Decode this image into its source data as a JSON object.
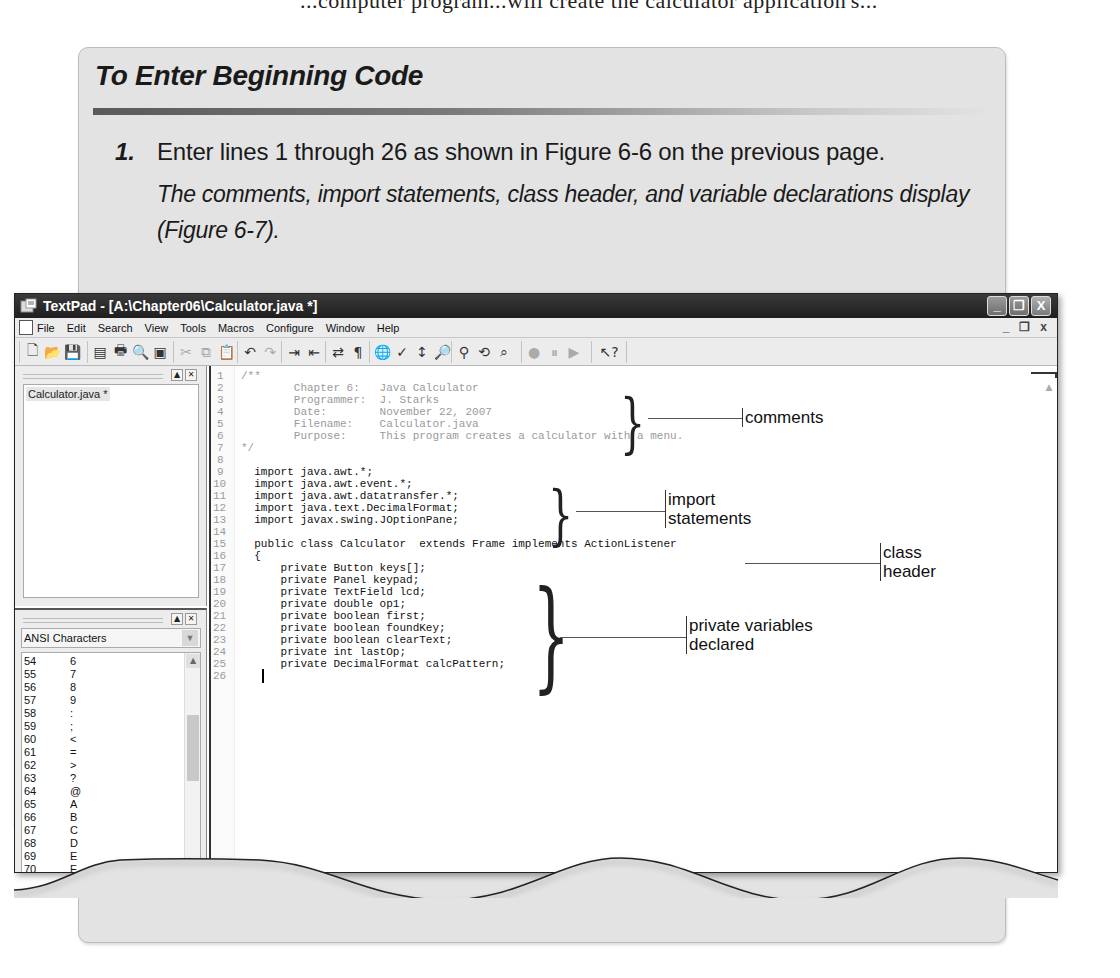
{
  "page": {
    "top_bleed_text": "...computer program...will create the calculator application's..."
  },
  "panel": {
    "title": "To Enter Beginning Code",
    "step_number": "1.",
    "step_text": "Enter lines 1 through 26 as shown in Figure 6-6 on the previous page.",
    "step_result": "The comments, import statements, class header, and variable declarations display (Figure 6-7).",
    "figure_caption": "FIGURE 6-7"
  },
  "window": {
    "title": "TextPad - [A:\\Chapter06\\Calculator.java *]",
    "controls": {
      "minimize": "_",
      "restore": "❐",
      "close": "X"
    },
    "menu": [
      "File",
      "Edit",
      "Search",
      "View",
      "Tools",
      "Macros",
      "Configure",
      "Window",
      "Help"
    ],
    "mdi_controls": {
      "minimize": "_",
      "restore": "❐",
      "close": "x"
    },
    "toolbar_groups": [
      [
        {
          "icon": "new-file-icon",
          "glyph": "🗋"
        },
        {
          "icon": "open-folder-icon",
          "glyph": "📂"
        },
        {
          "icon": "save-icon",
          "glyph": "💾"
        }
      ],
      [
        {
          "icon": "manage-files-icon",
          "glyph": "▤"
        },
        {
          "icon": "print-icon",
          "glyph": "🖶"
        },
        {
          "icon": "print-preview-icon",
          "glyph": "🔍"
        },
        {
          "icon": "properties-icon",
          "glyph": "▣"
        }
      ],
      [
        {
          "icon": "cut-icon",
          "glyph": "✂"
        },
        {
          "icon": "copy-icon",
          "glyph": "⧉"
        },
        {
          "icon": "paste-icon",
          "glyph": "📋"
        }
      ],
      [
        {
          "icon": "undo-icon",
          "glyph": "↶"
        },
        {
          "icon": "redo-icon",
          "glyph": "↷"
        }
      ],
      [
        {
          "icon": "indent-icon",
          "glyph": "⇥"
        },
        {
          "icon": "unindent-icon",
          "glyph": "⇤"
        }
      ],
      [
        {
          "icon": "word-wrap-icon",
          "glyph": "⇄"
        },
        {
          "icon": "pilcrow-icon",
          "glyph": "¶"
        }
      ],
      [
        {
          "icon": "web-browser-icon",
          "glyph": "🌐"
        },
        {
          "icon": "spelling-icon",
          "glyph": "✓"
        },
        {
          "icon": "sort-icon",
          "glyph": "↕"
        },
        {
          "icon": "find-icon",
          "glyph": "🔎"
        }
      ],
      [
        {
          "icon": "find-in-files-icon",
          "glyph": "⚲"
        },
        {
          "icon": "replace-icon",
          "glyph": "⟲"
        },
        {
          "icon": "binoculars-icon",
          "glyph": "⌕"
        }
      ],
      [
        {
          "icon": "record-macro-icon",
          "glyph": "●"
        },
        {
          "icon": "pause-macro-icon",
          "glyph": "⏸"
        },
        {
          "icon": "play-macro-icon",
          "glyph": "▶"
        }
      ],
      [
        {
          "icon": "context-help-icon",
          "glyph": "↖?"
        }
      ]
    ],
    "document_selector": {
      "files": [
        "Calculator.java *"
      ]
    },
    "clip_library": {
      "selected": "ANSI Characters",
      "rows": [
        {
          "code": "54",
          "char": "6"
        },
        {
          "code": "55",
          "char": "7"
        },
        {
          "code": "56",
          "char": "8"
        },
        {
          "code": "57",
          "char": "9"
        },
        {
          "code": "58",
          "char": ":"
        },
        {
          "code": "59",
          "char": ";"
        },
        {
          "code": "60",
          "char": "<"
        },
        {
          "code": "61",
          "char": "="
        },
        {
          "code": "62",
          "char": ">"
        },
        {
          "code": "63",
          "char": "?"
        },
        {
          "code": "64",
          "char": "@"
        },
        {
          "code": "65",
          "char": "A"
        },
        {
          "code": "66",
          "char": "B"
        },
        {
          "code": "67",
          "char": "C"
        },
        {
          "code": "68",
          "char": "D"
        },
        {
          "code": "69",
          "char": "E"
        },
        {
          "code": "70",
          "char": "F"
        },
        {
          "code": "71",
          "char": "G"
        },
        {
          "code": "72",
          "char": "H"
        },
        {
          "code": "73",
          "char": "I"
        },
        {
          "code": "74",
          "char": "J"
        },
        {
          "code": "75",
          "char": "K"
        }
      ]
    },
    "editor": {
      "lines": [
        {
          "n": "1",
          "text": "/**",
          "comment": true
        },
        {
          "n": "2",
          "text": "        Chapter 6:   Java Calculator",
          "comment": true
        },
        {
          "n": "3",
          "text": "        Programmer:  J. Starks",
          "comment": true
        },
        {
          "n": "4",
          "text": "        Date:        November 22, 2007",
          "comment": true
        },
        {
          "n": "5",
          "text": "        Filename:    Calculator.java",
          "comment": true
        },
        {
          "n": "6",
          "text": "        Purpose:     This program creates a calculator with a menu.",
          "comment": true
        },
        {
          "n": "7",
          "text": "*/",
          "comment": true
        },
        {
          "n": "8",
          "text": "",
          "comment": false
        },
        {
          "n": "9",
          "text": "  import java.awt.*;",
          "comment": false
        },
        {
          "n": "10",
          "text": "  import java.awt.event.*;",
          "comment": false
        },
        {
          "n": "11",
          "text": "  import java.awt.datatransfer.*;",
          "comment": false
        },
        {
          "n": "12",
          "text": "  import java.text.DecimalFormat;",
          "comment": false
        },
        {
          "n": "13",
          "text": "  import javax.swing.JOptionPane;",
          "comment": false
        },
        {
          "n": "14",
          "text": "",
          "comment": false
        },
        {
          "n": "15",
          "text": "  public class Calculator  extends Frame implements ActionListener",
          "comment": false
        },
        {
          "n": "16",
          "text": "  {",
          "comment": false
        },
        {
          "n": "17",
          "text": "      private Button keys[];",
          "comment": false
        },
        {
          "n": "18",
          "text": "      private Panel keypad;",
          "comment": false
        },
        {
          "n": "19",
          "text": "      private TextField lcd;",
          "comment": false
        },
        {
          "n": "20",
          "text": "      private double op1;",
          "comment": false
        },
        {
          "n": "21",
          "text": "      private boolean first;",
          "comment": false
        },
        {
          "n": "22",
          "text": "      private boolean foundKey;",
          "comment": false
        },
        {
          "n": "23",
          "text": "      private boolean clearText;",
          "comment": false
        },
        {
          "n": "24",
          "text": "      private int lastOp;",
          "comment": false
        },
        {
          "n": "25",
          "text": "      private DecimalFormat calcPattern;",
          "comment": false
        },
        {
          "n": "26",
          "text": "",
          "comment": false
        }
      ]
    }
  },
  "callouts": {
    "comments": "comments",
    "import_line1": "import",
    "import_line2": "statements",
    "class_line1": "class",
    "class_line2": "header",
    "vars_line1": "private variables",
    "vars_line2": "declared"
  }
}
